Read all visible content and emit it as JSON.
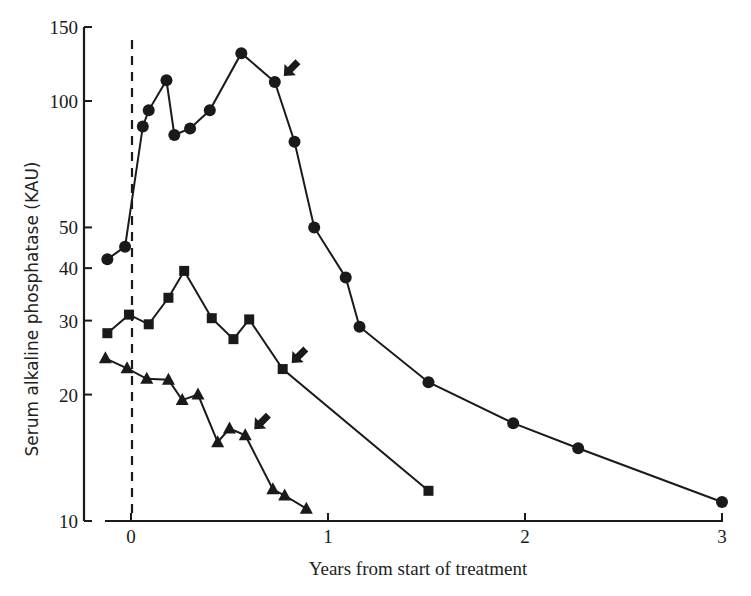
{
  "chart_data": {
    "type": "line",
    "title": "",
    "xlabel": "Years from start of treatment",
    "ylabel": "Serum alkaline phosphatase (KAU)",
    "yscale": "log",
    "xlim": [
      -0.13,
      3.0
    ],
    "ylim": [
      10,
      150
    ],
    "xticks": [
      0,
      1,
      2,
      3
    ],
    "xtick_labels": [
      "0",
      "1",
      "2",
      "3"
    ],
    "yticks": [
      10,
      20,
      30,
      40,
      50,
      100,
      150
    ],
    "ytick_labels": [
      "10",
      "20",
      "30",
      "40",
      "50",
      "100",
      "150"
    ],
    "grid": false,
    "legend": null,
    "annotations": [
      {
        "type": "vertical-dashed-line",
        "x": 0,
        "label": "start of treatment"
      },
      {
        "type": "arrow",
        "series": "circles",
        "at_x": 0.73,
        "at_y": 111
      },
      {
        "type": "arrow",
        "series": "squares",
        "at_x": 0.77,
        "at_y": 23
      },
      {
        "type": "arrow",
        "series": "triangles",
        "at_x": 0.58,
        "at_y": 16
      }
    ],
    "series": [
      {
        "name": "Patient A (circles)",
        "marker": "circle",
        "x": [
          -0.12,
          -0.03,
          0.06,
          0.09,
          0.18,
          0.22,
          0.3,
          0.4,
          0.56,
          0.73,
          0.83,
          0.93,
          1.09,
          1.16,
          1.51,
          1.94,
          2.27,
          3.0
        ],
        "values": [
          42,
          45,
          87,
          95,
          112,
          83,
          86,
          95,
          130,
          111,
          80,
          50,
          38,
          29,
          21.4,
          17.1,
          14.9,
          11.1
        ]
      },
      {
        "name": "Patient B (squares)",
        "marker": "square",
        "x": [
          -0.12,
          -0.01,
          0.09,
          0.19,
          0.27,
          0.41,
          0.52,
          0.6,
          0.77,
          1.51
        ],
        "values": [
          28,
          31,
          29.4,
          34,
          39.4,
          30.4,
          27.1,
          30.2,
          23,
          11.8
        ]
      },
      {
        "name": "Patient C (triangles)",
        "marker": "triangle",
        "x": [
          -0.13,
          -0.02,
          0.08,
          0.19,
          0.26,
          0.34,
          0.44,
          0.5,
          0.58,
          0.72,
          0.78,
          0.89
        ],
        "values": [
          24.4,
          23.1,
          21.8,
          21.7,
          19.4,
          20,
          15.4,
          16.6,
          16,
          11.9,
          11.5,
          10.7
        ]
      }
    ]
  },
  "layout": {
    "plot": {
      "x0_px": 131,
      "px_per_year": 197,
      "y_decade_px": 420,
      "y10_px": 521
    },
    "colors": {
      "ink": "#1a1a1a",
      "background": "#ffffff"
    }
  }
}
